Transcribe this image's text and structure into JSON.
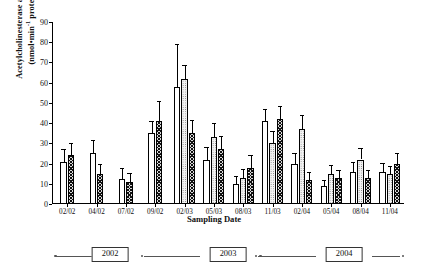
{
  "chart_data": {
    "type": "bar",
    "title": "",
    "xlabel": "Sampling Date",
    "ylabel_line1": "Acetylcholinesterase activity",
    "ylabel_line2_pre": "(nmol•min",
    "ylabel_line2_sup": "-1",
    "ylabel_line2_post": " protein)",
    "ylim": [
      0,
      90
    ],
    "ytick_step": 10,
    "yticks": [
      0,
      10,
      20,
      30,
      40,
      50,
      60,
      70,
      80,
      90
    ],
    "grid": false,
    "legend": "none",
    "categories": [
      "02/02",
      "04/02",
      "07/02",
      "09/02",
      "02/03",
      "05/03",
      "08/03",
      "11/03",
      "02/04",
      "05/04",
      "08/04",
      "11/04"
    ],
    "series": [
      {
        "name": "open",
        "pattern": "white",
        "values": [
          21,
          25,
          12.5,
          35,
          58,
          22,
          10,
          41,
          20,
          9,
          16,
          16
        ],
        "errors": [
          6,
          6.5,
          5.5,
          6,
          21,
          6,
          4,
          6,
          5,
          3,
          5,
          4.5
        ]
      },
      {
        "name": "dotted",
        "pattern": "stipple",
        "values": [
          null,
          null,
          null,
          null,
          62,
          33,
          13,
          30,
          37,
          15,
          22,
          15
        ],
        "errors": [
          null,
          null,
          null,
          null,
          6.5,
          7,
          4.5,
          6,
          7,
          4.5,
          5.5,
          4
        ]
      },
      {
        "name": "hatched",
        "pattern": "cross-hatch",
        "values": [
          24,
          15,
          11,
          41,
          35,
          27,
          18,
          42,
          12,
          13,
          13,
          20
        ],
        "errors": [
          6,
          5,
          4.5,
          10,
          6.5,
          6.5,
          6,
          6.5,
          4,
          4,
          4,
          5
        ]
      }
    ],
    "timeline": {
      "years": [
        "2002",
        "2003",
        "2004"
      ],
      "positions_pct": [
        16.5,
        50.0,
        83.0
      ]
    }
  }
}
